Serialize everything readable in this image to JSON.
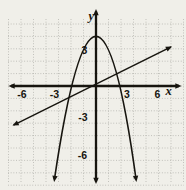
{
  "chart_data": {
    "type": "line",
    "title": "",
    "xlabel": "x",
    "ylabel": "y",
    "xlim": [
      -7,
      7
    ],
    "ylim": [
      -8,
      4.8
    ],
    "grid": "on, dotted, 1-unit squares, labels every 3 units",
    "legend": "none",
    "x_tick_labels": [
      "-6",
      "-3",
      "3",
      "6"
    ],
    "y_tick_labels": [
      "3",
      "-3",
      "-6"
    ],
    "series": [
      {
        "name": "parabola",
        "type": "quadratic",
        "equation": "y = 4 - x²",
        "vertex": [
          0,
          4
        ],
        "x_intercepts": [
          -2,
          2
        ],
        "ends": [
          [
            -3.32,
            -7.5
          ],
          [
            3.2,
            -7.5
          ]
        ],
        "points": [
          [
            -3,
            -5
          ],
          [
            -2,
            0
          ],
          [
            -1,
            3
          ],
          [
            0,
            4
          ],
          [
            1,
            3
          ],
          [
            2,
            0
          ],
          [
            3,
            -5
          ]
        ]
      },
      {
        "name": "line",
        "type": "linear",
        "equation": "y = x/2",
        "slope": 0.5,
        "y_intercept": 0,
        "ends": [
          [
            -6.6,
            -3.15
          ],
          [
            6.0,
            3.15
          ]
        ],
        "points": [
          [
            -6,
            -3
          ],
          [
            -3,
            -1.5
          ],
          [
            0,
            0
          ],
          [
            3,
            1.5
          ],
          [
            6,
            3
          ]
        ]
      }
    ],
    "colors": {
      "curve": "#17150f",
      "axis": "#17150f",
      "grid": "#b4b3ae",
      "background": "#f0efe9"
    }
  }
}
